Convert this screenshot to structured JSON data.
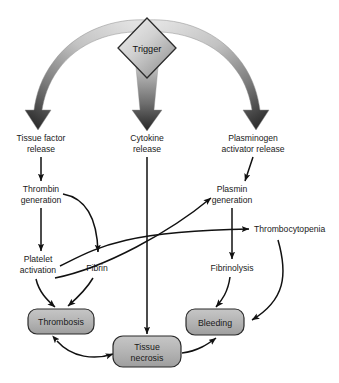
{
  "diagram": {
    "type": "flowchart",
    "background_color": "#ffffff",
    "palette": {
      "box_fill": "#b4b4b4",
      "box_stroke": "#2b2b2b",
      "diamond_fill_light": "#e8e8e8",
      "diamond_fill_dark": "#9a9a9a",
      "diamond_stroke": "#2b2b2b",
      "thick_arrow_light": "#d9d9d9",
      "thick_arrow_dark": "#2e2e2e",
      "line_color": "#111111",
      "text_color": "#1a1a1a"
    },
    "trigger": {
      "label": "Trigger",
      "shape": "diamond"
    },
    "release_nodes": [
      {
        "id": "tissue-factor-release",
        "line1": "Tissue factor",
        "line2": "release"
      },
      {
        "id": "cytokine-release",
        "line1": "Cytokine",
        "line2": "release"
      },
      {
        "id": "plasminogen-activator-release",
        "line1": "Plasminogen",
        "line2": "activator release"
      }
    ],
    "process_nodes": [
      {
        "id": "thrombin-generation",
        "line1": "Thrombin",
        "line2": "generation"
      },
      {
        "id": "plasmin-generation",
        "line1": "Plasmin",
        "line2": "generation"
      },
      {
        "id": "platelet-activation",
        "line1": "Platelet",
        "line2": "activation"
      },
      {
        "id": "fibrin",
        "line1": "Fibrin",
        "line2": ""
      },
      {
        "id": "thrombocytopenia",
        "line1": "Thrombocytopenia",
        "line2": ""
      },
      {
        "id": "fibrinolysis",
        "line1": "Fibrinolysis",
        "line2": ""
      }
    ],
    "outcome_boxes": [
      {
        "id": "thrombosis",
        "line1": "Thrombosis",
        "line2": ""
      },
      {
        "id": "tissue-necrosis",
        "line1": "Tissue",
        "line2": "necrosis"
      },
      {
        "id": "bleeding",
        "line1": "Bleeding",
        "line2": ""
      }
    ],
    "edges": [
      {
        "from": "trigger",
        "to": "tissue-factor-release",
        "style": "thick-curved-gradient"
      },
      {
        "from": "trigger",
        "to": "cytokine-release",
        "style": "thick-straight-gradient"
      },
      {
        "from": "trigger",
        "to": "plasminogen-activator-release",
        "style": "thick-curved-gradient"
      },
      {
        "from": "tissue-factor-release",
        "to": "thrombin-generation",
        "style": "straight"
      },
      {
        "from": "plasminogen-activator-release",
        "to": "plasmin-generation",
        "style": "straight"
      },
      {
        "from": "thrombin-generation",
        "to": "platelet-activation",
        "style": "straight"
      },
      {
        "from": "thrombin-generation",
        "to": "fibrin",
        "style": "curved"
      },
      {
        "from": "platelet-activation",
        "to": "thrombosis",
        "style": "curved"
      },
      {
        "from": "fibrin",
        "to": "thrombosis",
        "style": "curved"
      },
      {
        "from": "thrombin-generation-branch",
        "to": "plasmin-generation",
        "style": "curved"
      },
      {
        "from": "thrombin-generation-branch",
        "to": "thrombocytopenia",
        "style": "straight"
      },
      {
        "from": "plasmin-generation",
        "to": "fibrinolysis",
        "style": "straight"
      },
      {
        "from": "fibrinolysis",
        "to": "bleeding",
        "style": "curved"
      },
      {
        "from": "thrombocytopenia",
        "to": "bleeding",
        "style": "curved"
      },
      {
        "from": "cytokine-release",
        "to": "tissue-necrosis",
        "style": "straight-long"
      },
      {
        "from": "thrombosis",
        "to": "tissue-necrosis",
        "style": "double-headed-curved"
      },
      {
        "from": "tissue-necrosis",
        "to": "bleeding",
        "style": "curved"
      }
    ]
  }
}
